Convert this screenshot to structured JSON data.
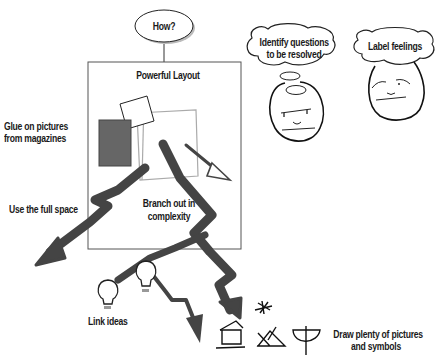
{
  "diagram": {
    "question_bubble": "How?",
    "layout_box_title": "Powerful Layout",
    "layout_box_caption": [
      "Branch out in",
      "complexity"
    ],
    "labels": {
      "glue_pictures": [
        "Glue on pictures",
        "from magazines"
      ],
      "use_full_space": "Use the full space",
      "link_ideas": "Link ideas",
      "draw_pictures": [
        "Draw plenty of pictures",
        "and symbols"
      ]
    },
    "thought_bubbles": [
      {
        "text": [
          "Identify questions",
          "to be resolved"
        ],
        "face": "thinking-face"
      },
      {
        "text": [
          "Label feelings"
        ],
        "face": "content-face"
      }
    ],
    "symbols": [
      "asterisk-symbol",
      "house-symbol",
      "mountain-symbol",
      "bowl-symbol"
    ],
    "icons": [
      "lightbulb-icon",
      "lightbulb-icon"
    ],
    "colors": {
      "arrow": "#444444",
      "filled_picture": "#666666",
      "outline": "#1a1a1a",
      "light_outline": "#aaaaaa"
    }
  }
}
